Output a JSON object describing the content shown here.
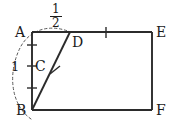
{
  "figure": {
    "type": "geometry-diagram",
    "background_color": "#ffffff",
    "stroke_color": "#2b2b2b",
    "dash_color": "#555555",
    "points": [
      {
        "id": "A",
        "label": "A",
        "x": 32,
        "y": 32,
        "label_x": 15,
        "label_y": 25
      },
      {
        "id": "B",
        "label": "B",
        "x": 32,
        "y": 110,
        "label_x": 16,
        "label_y": 104
      },
      {
        "id": "C",
        "label": "C",
        "x": 32,
        "y": 66,
        "label_x": 35,
        "label_y": 59
      },
      {
        "id": "D",
        "label": "D",
        "x": 70,
        "y": 32,
        "label_x": 72,
        "label_y": 34
      },
      {
        "id": "E",
        "label": "E",
        "x": 152,
        "y": 32,
        "label_x": 156,
        "label_y": 25
      },
      {
        "id": "F",
        "label": "F",
        "x": 152,
        "y": 110,
        "label_x": 156,
        "label_y": 104
      }
    ],
    "segments": [
      {
        "name": "side-AE-top",
        "from": "A",
        "to": "E"
      },
      {
        "name": "side-EF-right",
        "from": "E",
        "to": "F"
      },
      {
        "name": "side-FB-bottom",
        "from": "F",
        "to": "B"
      },
      {
        "name": "side-BA-left",
        "from": "B",
        "to": "A"
      },
      {
        "name": "segment-BD",
        "from": "B",
        "to": "D"
      }
    ],
    "arc": {
      "name": "arc-centered-at-B-through-D",
      "center": "B",
      "radius": 87,
      "style": "dashed"
    },
    "tick_marks": [
      {
        "name": "tick-AB-upper",
        "x": 32,
        "y": 45,
        "orientation": "horizontal"
      },
      {
        "name": "tick-AB-middle",
        "x": 32,
        "y": 66,
        "orientation": "horizontal"
      },
      {
        "name": "tick-AB-lower",
        "x": 32,
        "y": 88,
        "orientation": "horizontal"
      },
      {
        "name": "tick-top-edge",
        "x": 106,
        "y": 32,
        "orientation": "vertical"
      },
      {
        "name": "tick-BD",
        "x": 55,
        "y": 70,
        "orientation": "cross-segment"
      }
    ],
    "measure_labels": {
      "left_side_length": "1",
      "top_fraction_numerator": "1",
      "top_fraction_denominator": "2"
    }
  }
}
